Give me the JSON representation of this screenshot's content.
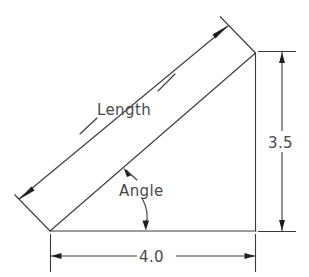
{
  "diagram": {
    "type": "engineering-dimension-drawing",
    "background_color": "#ffffff",
    "line_color": "#3a3a3a",
    "text_color": "#4a4a4a",
    "arrow_color": "#1f1f1f"
  },
  "labels": {
    "length": "Length",
    "angle": "Angle",
    "height_dimension": "3.5",
    "base_dimension": "4.0"
  },
  "geometry": {
    "vertices": {
      "bottom_left": {
        "x": 50,
        "y": 231
      },
      "bottom_right": {
        "x": 255,
        "y": 231
      },
      "apex": {
        "x": 255,
        "y": 53
      }
    },
    "base_length": "4.0",
    "height": "3.5",
    "hypotenuse_label": "Length",
    "interior_angle_label": "Angle"
  },
  "dimensions": [
    {
      "name": "hypotenuse-length",
      "label": "Length",
      "orientation": "diagonal",
      "arrow_start": {
        "x": 22,
        "y": 202
      },
      "arrow_end": {
        "x": 225,
        "y": 23
      }
    },
    {
      "name": "vertical-height",
      "label": "3.5",
      "orientation": "vertical",
      "arrow_start": {
        "x": 282,
        "y": 53
      },
      "arrow_end": {
        "x": 282,
        "y": 231
      }
    },
    {
      "name": "horizontal-base",
      "label": "4.0",
      "orientation": "horizontal",
      "arrow_start": {
        "x": 50,
        "y": 256
      },
      "arrow_end": {
        "x": 255,
        "y": 256
      }
    }
  ]
}
